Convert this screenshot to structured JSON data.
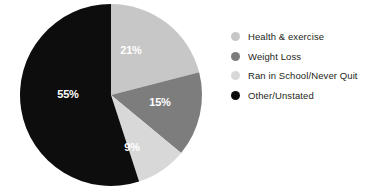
{
  "chart_data": {
    "type": "pie",
    "title": "",
    "subtitle": "",
    "xlabel": "",
    "ylabel": "",
    "grid": false,
    "legend_position": "right",
    "start_angle_deg": 0,
    "direction": "clockwise",
    "categories": [
      "Health & exercise",
      "Weight Loss",
      "Ran in School/Never Quit",
      "Other/Unstated"
    ],
    "values": [
      21,
      15,
      9,
      55
    ],
    "value_unit": "%",
    "colors": [
      "#c7c7c7",
      "#7d7d7d",
      "#d8d8d8",
      "#0d0d0d"
    ],
    "slices": [
      {
        "label": "Health & exercise",
        "value": 21,
        "display": "21%",
        "color": "#c7c7c7",
        "label_color": "#ffffff",
        "label_x": 131,
        "label_y": 50
      },
      {
        "label": "Weight Loss",
        "value": 15,
        "display": "15%",
        "color": "#7d7d7d",
        "label_color": "#ffffff",
        "label_x": 160,
        "label_y": 102
      },
      {
        "label": "Ran in School/Never Quit",
        "value": 9,
        "display": "9%",
        "color": "#d8d8d8",
        "label_color": "#ffffff",
        "label_x": 132,
        "label_y": 147
      },
      {
        "label": "Other/Unstated",
        "value": 55,
        "display": "55%",
        "color": "#0d0d0d",
        "label_color": "#ffffff",
        "label_x": 68,
        "label_y": 94
      }
    ]
  },
  "legend": {
    "items": [
      {
        "label": "Health & exercise",
        "color": "#c7c7c7"
      },
      {
        "label": "Weight Loss",
        "color": "#7d7d7d"
      },
      {
        "label": "Ran in School/Never Quit",
        "color": "#d8d8d8"
      },
      {
        "label": "Other/Unstated",
        "color": "#0d0d0d"
      }
    ]
  },
  "theme": {
    "background": "#ffffff",
    "text_color": "#231f20"
  }
}
